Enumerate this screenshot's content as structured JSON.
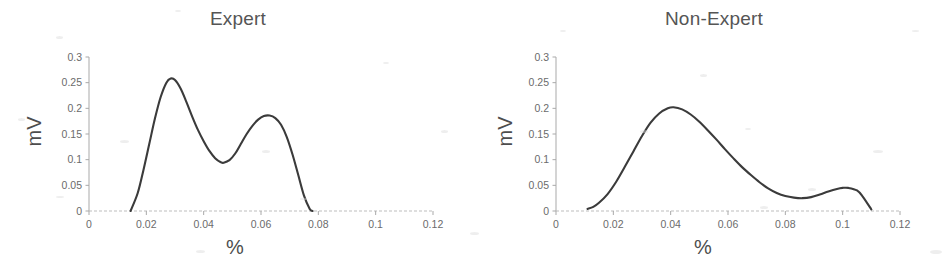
{
  "figure": {
    "background_color": "#ffffff",
    "curve_color": "#3b3b3b",
    "axis_color": "#a9a9a9",
    "text_color": "#595959"
  },
  "panels": [
    {
      "id": "expert",
      "title": "Expert",
      "x_axis_title": "%",
      "y_axis_title": "mV"
    },
    {
      "id": "non-expert",
      "title": "Non-Expert",
      "x_axis_title": "%",
      "y_axis_title": "mV"
    }
  ],
  "chart_data": [
    {
      "type": "line",
      "title": "Expert",
      "xlabel": "%",
      "ylabel": "mV",
      "xlim": [
        0,
        0.12
      ],
      "ylim": [
        0,
        0.3
      ],
      "xticks": [
        0,
        0.02,
        0.04,
        0.06,
        0.08,
        0.1,
        0.12
      ],
      "xtick_labels": [
        "0",
        "0.02",
        "0.04",
        "0.06",
        "0.08",
        "0.1",
        "0.12"
      ],
      "yticks": [
        0,
        0.05,
        0.1,
        0.15,
        0.2,
        0.25,
        0.3
      ],
      "ytick_labels": [
        "0",
        "0.05",
        "0.1",
        "0.15",
        "0.2",
        "0.25",
        "0.3"
      ],
      "grid": false,
      "legend": null,
      "series": [
        {
          "name": "Expert",
          "color": "#3b3b3b",
          "x": [
            0.0145,
            0.017,
            0.019,
            0.021,
            0.023,
            0.025,
            0.027,
            0.0285,
            0.03,
            0.032,
            0.034,
            0.036,
            0.038,
            0.04,
            0.042,
            0.044,
            0.046,
            0.047,
            0.049,
            0.051,
            0.053,
            0.055,
            0.057,
            0.059,
            0.061,
            0.063,
            0.065,
            0.067,
            0.069,
            0.071,
            0.073,
            0.075,
            0.077,
            0.078
          ],
          "y": [
            0.0,
            0.035,
            0.08,
            0.13,
            0.18,
            0.222,
            0.25,
            0.258,
            0.255,
            0.238,
            0.212,
            0.184,
            0.158,
            0.136,
            0.117,
            0.103,
            0.095,
            0.094,
            0.099,
            0.112,
            0.131,
            0.15,
            0.166,
            0.178,
            0.185,
            0.186,
            0.181,
            0.168,
            0.144,
            0.11,
            0.07,
            0.03,
            0.004,
            0.0
          ]
        }
      ],
      "annotations": {
        "peak_1": {
          "x": 0.0285,
          "y": 0.258
        },
        "valley": {
          "x": 0.047,
          "y": 0.094
        },
        "peak_2": {
          "x": 0.063,
          "y": 0.186
        },
        "curve_start_x": 0.0145,
        "curve_end_x": 0.078
      }
    },
    {
      "type": "line",
      "title": "Non-Expert",
      "xlabel": "%",
      "ylabel": "mV",
      "xlim": [
        0,
        0.12
      ],
      "ylim": [
        0,
        0.3
      ],
      "xticks": [
        0,
        0.02,
        0.04,
        0.06,
        0.08,
        0.1,
        0.12
      ],
      "xtick_labels": [
        "0",
        "0.02",
        "0.04",
        "0.06",
        "0.08",
        "0.1",
        "0.12"
      ],
      "yticks": [
        0,
        0.05,
        0.1,
        0.15,
        0.2,
        0.25,
        0.3
      ],
      "ytick_labels": [
        "0",
        "0.05",
        "0.1",
        "0.15",
        "0.2",
        "0.25",
        "0.3"
      ],
      "grid": false,
      "legend": null,
      "series": [
        {
          "name": "Non-Expert",
          "color": "#3b3b3b",
          "x": [
            0.011,
            0.013,
            0.015,
            0.018,
            0.021,
            0.024,
            0.027,
            0.03,
            0.033,
            0.036,
            0.039,
            0.041,
            0.044,
            0.047,
            0.05,
            0.053,
            0.056,
            0.059,
            0.062,
            0.065,
            0.068,
            0.071,
            0.074,
            0.077,
            0.08,
            0.083,
            0.086,
            0.089,
            0.092,
            0.095,
            0.098,
            0.1,
            0.102,
            0.105,
            0.107,
            0.11
          ],
          "y": [
            0.004,
            0.008,
            0.016,
            0.033,
            0.057,
            0.086,
            0.116,
            0.146,
            0.172,
            0.19,
            0.2,
            0.202,
            0.198,
            0.188,
            0.174,
            0.157,
            0.139,
            0.12,
            0.102,
            0.085,
            0.07,
            0.056,
            0.044,
            0.035,
            0.029,
            0.026,
            0.025,
            0.027,
            0.032,
            0.038,
            0.043,
            0.045,
            0.045,
            0.04,
            0.028,
            0.003
          ]
        }
      ],
      "annotations": {
        "peak_1": {
          "x": 0.041,
          "y": 0.202
        },
        "valley": {
          "x": 0.086,
          "y": 0.025
        },
        "peak_2": {
          "x": 0.1,
          "y": 0.045
        },
        "curve_start_x": 0.011,
        "curve_end_x": 0.11
      }
    }
  ]
}
